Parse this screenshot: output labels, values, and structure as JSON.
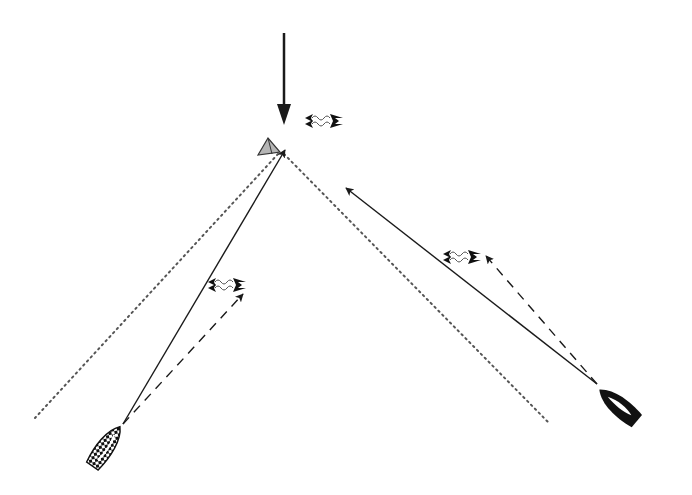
{
  "diagram": {
    "type": "sailing-tactics",
    "colors": {
      "line": "#1a1a1a",
      "layline": "#555555",
      "mark_fill": "#b5b5b5",
      "boat_dark": "#111111",
      "boat_checker_light": "#ffffff"
    },
    "wind_arrow": {
      "x": 284,
      "y1": 33,
      "y2": 125,
      "label": "wind-direction"
    },
    "mark": {
      "x": 270,
      "y": 148,
      "shape": "triangle-buoy"
    },
    "laylines": [
      {
        "name": "port-layline",
        "x1": 278,
        "y1": 152,
        "x2": 35,
        "y2": 418
      },
      {
        "name": "starboard-layline",
        "x1": 282,
        "y1": 152,
        "x2": 548,
        "y2": 422
      }
    ],
    "boats": [
      {
        "name": "checkered-boat",
        "x": 105,
        "y": 448,
        "angle": 35,
        "style": "checkered"
      },
      {
        "name": "black-boat",
        "x": 620,
        "y": 407,
        "angle": -50,
        "style": "solid"
      }
    ],
    "tracks": [
      {
        "name": "checkered-boat-course",
        "x1": 123,
        "y1": 424,
        "x2": 285,
        "y2": 150,
        "style": "solid"
      },
      {
        "name": "checkered-boat-heading-lifted",
        "x1": 123,
        "y1": 424,
        "x2": 243,
        "y2": 294,
        "style": "dashed"
      },
      {
        "name": "black-boat-course",
        "x1": 597,
        "y1": 384,
        "x2": 346,
        "y2": 188,
        "style": "solid"
      },
      {
        "name": "black-boat-heading-lifted",
        "x1": 597,
        "y1": 384,
        "x2": 486,
        "y2": 256,
        "style": "dashed"
      }
    ],
    "wind_shift_symbols": [
      {
        "name": "wind-shift-top",
        "x": 305,
        "y": 121
      },
      {
        "name": "wind-shift-left",
        "x": 208,
        "y": 285
      },
      {
        "name": "wind-shift-right",
        "x": 443,
        "y": 257
      }
    ]
  }
}
